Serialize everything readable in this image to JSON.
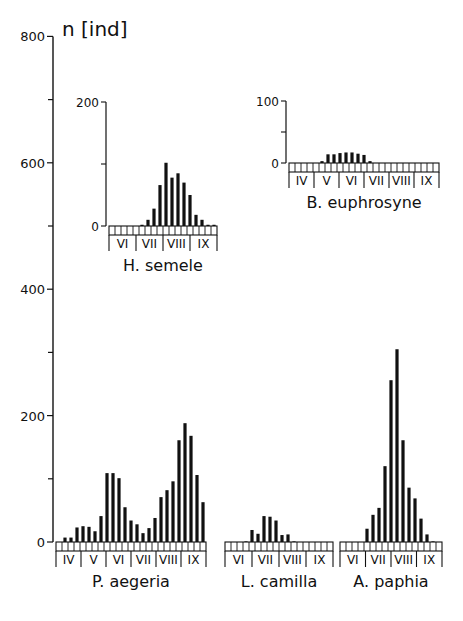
{
  "chart_data": {
    "type": "bar",
    "title": "",
    "ylabel": "n [ind]",
    "main_axis": {
      "ylim": [
        0,
        800
      ],
      "ticks": [
        0,
        200,
        400,
        600,
        800
      ],
      "minor_ticks": [
        100,
        300,
        500,
        700
      ]
    },
    "panels": [
      {
        "name": "P. aegeria",
        "months": [
          "IV",
          "V",
          "VI",
          "VII",
          "VIII",
          "IX"
        ],
        "ylim": [
          0,
          800
        ],
        "values": [
          0,
          7,
          7,
          23,
          25,
          24,
          17,
          41,
          109,
          109,
          101,
          55,
          34,
          28,
          14,
          22,
          38,
          71,
          82,
          96,
          161,
          188,
          168,
          106,
          63
        ]
      },
      {
        "name": "L. camilla",
        "months": [
          "VI",
          "VII",
          "VIII",
          "IX"
        ],
        "ylim": [
          0,
          800
        ],
        "values": [
          0,
          0,
          0,
          1,
          19,
          13,
          41,
          40,
          34,
          11,
          12,
          1,
          0,
          0,
          0,
          0,
          0,
          0
        ]
      },
      {
        "name": "A. paphia",
        "months": [
          "VI",
          "VII",
          "VIII",
          "IX"
        ],
        "ylim": [
          0,
          800
        ],
        "values": [
          0,
          0,
          0,
          0,
          21,
          43,
          54,
          120,
          256,
          305,
          161,
          86,
          69,
          37,
          12,
          1,
          0
        ]
      },
      {
        "name": "H. semele",
        "months": [
          "VI",
          "VII",
          "VIII",
          "IX"
        ],
        "ylim": [
          0,
          200
        ],
        "ticks": [
          0,
          200
        ],
        "values": [
          0,
          0,
          0,
          0,
          0,
          2,
          10,
          28,
          66,
          102,
          78,
          85,
          70,
          50,
          18,
          10,
          2,
          2
        ]
      },
      {
        "name": "B. euphrosyne",
        "months": [
          "IV",
          "V",
          "VI",
          "VII",
          "VIII",
          "IX"
        ],
        "ylim": [
          0,
          100
        ],
        "ticks": [
          0,
          100
        ],
        "values": [
          0,
          0,
          0,
          0,
          0,
          3,
          14,
          14,
          16,
          17,
          17,
          15,
          13,
          3,
          0,
          0,
          0,
          0,
          0,
          0,
          0,
          0,
          0,
          0,
          0
        ]
      }
    ],
    "axis_tick_labels": [
      "0",
      "200",
      "400",
      "600",
      "800"
    ],
    "grid": false,
    "legend": null
  }
}
